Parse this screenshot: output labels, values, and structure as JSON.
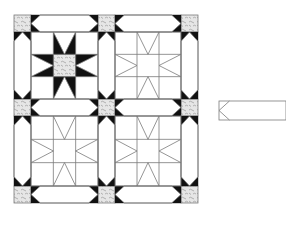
{
  "diagram": {
    "type": "quilt-layout",
    "colors": {
      "background": "#ffffff",
      "line": "#7a7a7a",
      "star_point": "#111111",
      "print_fill": "#e4e4e4",
      "print_mark": "#8a8a8a"
    },
    "quilt": {
      "columns": [
        14,
        31,
        98,
        115,
        181,
        198
      ],
      "rows": [
        15,
        32,
        99,
        116,
        186,
        203
      ],
      "blocks": [
        {
          "id": "block-top-left",
          "filled": true
        },
        {
          "id": "block-top-right",
          "filled": false
        },
        {
          "id": "block-bottom-left",
          "filled": false
        },
        {
          "id": "block-bottom-right",
          "filled": false
        }
      ],
      "cornerstones": 9,
      "sashing_strips": 12
    },
    "strip_template": {
      "x": 219,
      "y": 101,
      "width": 67,
      "height": 19
    }
  }
}
